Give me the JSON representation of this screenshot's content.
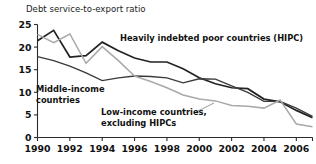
{
  "chart_data": {
    "type": "line",
    "title": "Debt service-to-export ratio",
    "xlabel": "",
    "ylabel": "",
    "xlim": [
      1990,
      2007
    ],
    "ylim": [
      0,
      25
    ],
    "yticks": [
      0,
      5,
      10,
      15,
      20,
      25
    ],
    "ytick_labels": [
      "0",
      "5",
      "10",
      "15",
      "20",
      "25"
    ],
    "xticks": [
      1990,
      1992,
      1994,
      1996,
      1998,
      2000,
      2002,
      2004,
      2006
    ],
    "xtick_labels": [
      "1990",
      "1992",
      "1994",
      "1996",
      "1998",
      "2000",
      "2002",
      "2004",
      "2006"
    ],
    "grid": false,
    "legend_position": "inline-annotations",
    "x": [
      1990,
      1991,
      1992,
      1993,
      1994,
      1995,
      1996,
      1997,
      1998,
      1999,
      2000,
      2001,
      2002,
      2003,
      2004,
      2005,
      2006,
      2007
    ],
    "series": [
      {
        "name": "Heavily indebted poor countries (HIPC)",
        "color": "#222222",
        "values": [
          21.4,
          23.7,
          17.8,
          18.1,
          21.1,
          19.2,
          17.6,
          16.7,
          16.7,
          15.2,
          13.2,
          11.9,
          11.0,
          10.8,
          8.5,
          7.9,
          6.0,
          4.4
        ]
      },
      {
        "name": "Middle-income countries",
        "color": "#3a3a3a",
        "values": [
          17.9,
          17.0,
          15.8,
          14.3,
          12.6,
          13.2,
          13.6,
          13.5,
          13.2,
          12.1,
          13.0,
          12.9,
          11.4,
          10.0,
          8.0,
          8.0,
          6.5,
          4.7
        ]
      },
      {
        "name": "Low-income countries, excluding HIPCs",
        "color": "#a9a9a9",
        "values": [
          22.8,
          21.0,
          22.9,
          16.4,
          20.1,
          17.0,
          13.6,
          12.4,
          11.0,
          9.4,
          8.5,
          8.1,
          7.1,
          6.9,
          6.5,
          8.3,
          3.0,
          2.4
        ]
      }
    ],
    "annotations": [
      {
        "id": "hipc",
        "text_lines": [
          "Heavily indebted poor countries (HIPC)"
        ],
        "x_px": 120,
        "y_px": 41
      },
      {
        "id": "middle-income",
        "text_lines": [
          "Middle-income",
          "countries"
        ],
        "x_px": 36,
        "y_px": 92
      },
      {
        "id": "low-income",
        "text_lines": [
          "Low-income countries,",
          "excluding HIPCs"
        ],
        "x_px": 101,
        "y_px": 115
      }
    ]
  }
}
